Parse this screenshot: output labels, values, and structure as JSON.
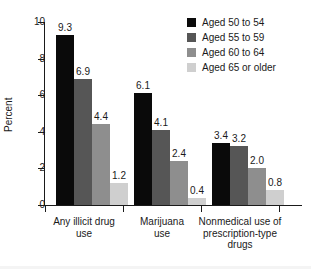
{
  "chart_data": {
    "type": "bar",
    "title": "",
    "subtitle": "",
    "xlabel": "",
    "ylabel": "Percent",
    "ylim": [
      0,
      10
    ],
    "yticks": [
      "0",
      "2",
      "4",
      "6",
      "8",
      "10"
    ],
    "grid": false,
    "legend_position": "top-right",
    "categories": [
      "Any illicit drug use",
      "Marijuana use",
      "Nonmedical use of prescription-type drugs"
    ],
    "category_lines": [
      [
        "Any illicit drug",
        "use"
      ],
      [
        "Marijuana",
        "use"
      ],
      [
        "Nonmedical use of",
        "prescription-type",
        "drugs"
      ]
    ],
    "series": [
      {
        "name": "Aged 50 to 54",
        "color": "#0a0a0a",
        "values": [
          9.3,
          6.1,
          3.4
        ],
        "labels": [
          "9.3",
          "6.1",
          "3.4"
        ]
      },
      {
        "name": "Aged 55 to 59",
        "color": "#565656",
        "values": [
          6.9,
          4.1,
          3.2
        ],
        "labels": [
          "6.9",
          "4.1",
          "3.2"
        ]
      },
      {
        "name": "Aged 60 to 64",
        "color": "#8e8e8e",
        "values": [
          4.4,
          2.4,
          2.0
        ],
        "labels": [
          "4.4",
          "2.4",
          "2.0"
        ]
      },
      {
        "name": "Aged 65 or older",
        "color": "#cfcfcf",
        "values": [
          1.2,
          0.4,
          0.8
        ],
        "labels": [
          "1.2",
          "0.4",
          "0.8"
        ]
      }
    ]
  },
  "legend": {
    "items": [
      {
        "label": "Aged 50 to 54",
        "color": "#0a0a0a"
      },
      {
        "label": "Aged 55 to 59",
        "color": "#565656"
      },
      {
        "label": "Aged 60 to 64",
        "color": "#8e8e8e"
      },
      {
        "label": "Aged 65 or older",
        "color": "#cfcfcf"
      }
    ]
  }
}
